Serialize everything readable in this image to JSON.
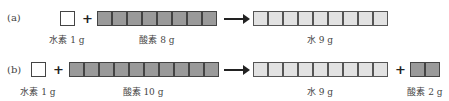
{
  "rows": [
    {
      "label": "(a)",
      "reactants": [
        {
          "name": "水素",
          "mass": "1 g",
          "caption": "水素 1 g",
          "blocks": 1,
          "style": "white"
        },
        {
          "name": "酸素",
          "mass": "8 g",
          "caption": "酸素 8 g",
          "blocks": 8,
          "style": "dark"
        }
      ],
      "products": [
        {
          "name": "水",
          "mass": "9 g",
          "caption": "水 9 g",
          "blocks": 9,
          "style": "light"
        }
      ],
      "plus": "+",
      "arrow": "arrow-right-icon"
    },
    {
      "label": "(b)",
      "reactants": [
        {
          "name": "水素",
          "mass": "1 g",
          "caption": "水素 1 g",
          "blocks": 1,
          "style": "white"
        },
        {
          "name": "酸素",
          "mass": "10 g",
          "caption": "酸素 10 g",
          "blocks": 10,
          "style": "dark"
        }
      ],
      "products": [
        {
          "name": "水",
          "mass": "9 g",
          "caption": "水 9 g",
          "blocks": 9,
          "style": "light"
        },
        {
          "name": "酸素",
          "mass": "2 g",
          "caption": "酸素 2 g",
          "blocks": 2,
          "style": "dark"
        }
      ],
      "plus": "+",
      "arrow": "arrow-right-icon"
    }
  ],
  "colors": {
    "hydrogen_block": "#ffffff",
    "oxygen_block": "#9a9a9a",
    "water_block": "#e2e2e2",
    "border": "#444444"
  }
}
